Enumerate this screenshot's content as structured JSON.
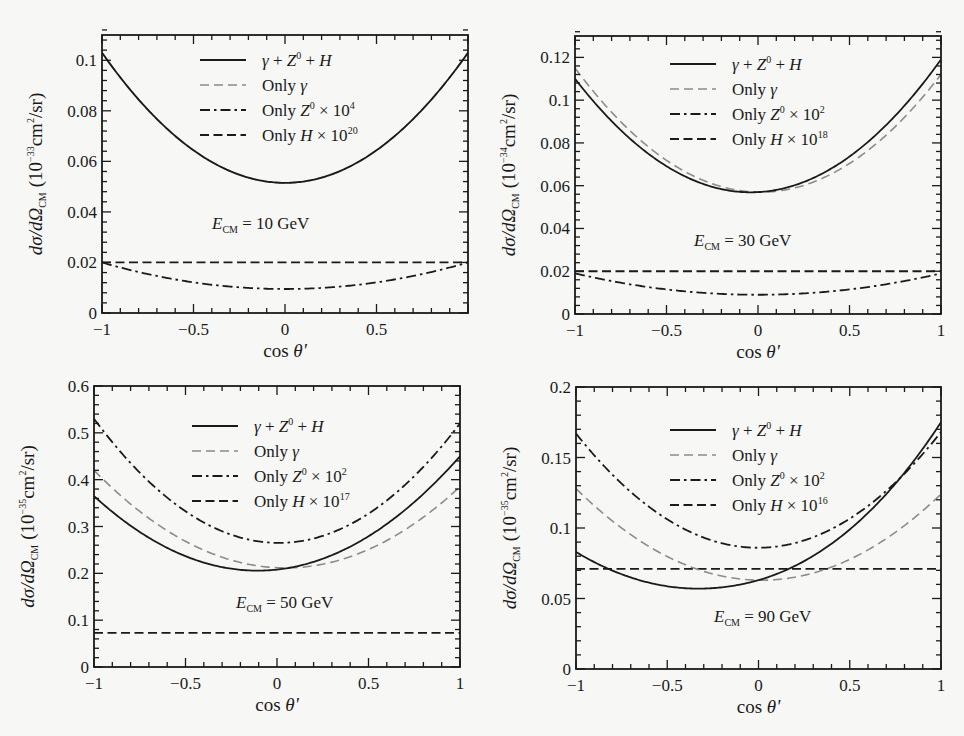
{
  "figure": {
    "x_axis_label": "cos θ'",
    "y_axis_label_prefix": "dσ/dΩ",
    "y_axis_label_sub": "CM",
    "colors": {
      "total": "#1a1a1a",
      "only_gamma": "#8c8c8c",
      "only_z": "#1a1a1a",
      "only_h": "#1a1a1a",
      "background": "#f7f7f5"
    }
  },
  "chart_data": [
    {
      "type": "line",
      "id": "panel-10gev",
      "annotation": "E_CM = 10 GeV",
      "annotation_energy": "= 10 GeV",
      "xlabel": "cos θ'",
      "ylabel": "dσ/dΩ_CM (10^-33 cm^2/sr)",
      "ylabel_exp": "−33",
      "xlim": [
        -1,
        1
      ],
      "ylim": [
        0,
        0.11
      ],
      "xticks": [
        -1,
        -0.5,
        0,
        0.5
      ],
      "xtick_labels": [
        "−1",
        "−0.5",
        "0",
        "0.5"
      ],
      "yticks": [
        0,
        0.02,
        0.04,
        0.06,
        0.08,
        0.1
      ],
      "ytick_labels": [
        "0",
        "0.02",
        "0.04",
        "0.06",
        "0.08",
        "0.1"
      ],
      "grid": false,
      "legend_position": "upper center",
      "frame": {
        "left": 102,
        "top": 35,
        "right": 468,
        "bottom": 313
      },
      "legend": {
        "x": 200,
        "y": 60,
        "dy": 25
      },
      "annot_pos": {
        "x": 212,
        "y": 229
      },
      "series": [
        {
          "name": "γ + Z⁰ + H",
          "legend_main": "γ + Z",
          "legend_sup": "0",
          "legend_tail": " + H",
          "style": "solid",
          "at_minus1": 0.103,
          "at_0": 0.0515,
          "at_plus1": 0.103,
          "min_x": 0.0
        },
        {
          "name": "Only γ",
          "legend_main": "Only γ",
          "legend_sup": "",
          "legend_tail": "",
          "style": "gray-dashed",
          "at_minus1": 0.103,
          "at_0": 0.0515,
          "at_plus1": 0.103,
          "min_x": 0.0
        },
        {
          "name": "Only Z⁰ × 10⁴",
          "legend_main": "Only Z",
          "legend_sup": "0",
          "legend_tail": " × 10",
          "legend_exp": "4",
          "style": "dash-dot",
          "at_minus1": 0.02,
          "at_0": 0.0095,
          "at_plus1": 0.02,
          "min_x": 0.0
        },
        {
          "name": "Only H × 10²⁰",
          "legend_main": "Only H",
          "legend_sup": "",
          "legend_tail": " × 10",
          "legend_exp": "20",
          "style": "dashed",
          "at_minus1": 0.02,
          "at_0": 0.02,
          "at_plus1": 0.02,
          "min_x": 0.0
        }
      ]
    },
    {
      "type": "line",
      "id": "panel-30gev",
      "annotation": "E_CM = 30 GeV",
      "annotation_energy": "= 30 GeV",
      "xlabel": "cos θ'",
      "ylabel": "dσ/dΩ_CM (10^-34 cm^2/sr)",
      "ylabel_exp": "−34",
      "xlim": [
        -1,
        1
      ],
      "ylim": [
        0,
        0.13
      ],
      "xticks": [
        -1,
        -0.5,
        0,
        0.5,
        1
      ],
      "xtick_labels": [
        "−1",
        "−0.5",
        "0",
        "0.5",
        "1"
      ],
      "yticks": [
        0,
        0.02,
        0.04,
        0.06,
        0.08,
        0.1,
        0.12
      ],
      "ytick_labels": [
        "0",
        "0.02",
        "0.04",
        "0.06",
        "0.08",
        "0.1",
        "0.12"
      ],
      "grid": false,
      "legend_position": "upper center",
      "frame": {
        "left": 575,
        "top": 36,
        "right": 941,
        "bottom": 314
      },
      "legend": {
        "x": 670,
        "y": 64,
        "dy": 25
      },
      "annot_pos": {
        "x": 694,
        "y": 246
      },
      "series": [
        {
          "name": "γ + Z⁰ + H",
          "legend_main": "γ + Z",
          "legend_sup": "0",
          "legend_tail": " + H",
          "style": "solid",
          "at_minus1": 0.11,
          "at_0": 0.057,
          "at_plus1": 0.119,
          "min_x": -0.02
        },
        {
          "name": "Only γ",
          "legend_main": "Only γ",
          "legend_sup": "",
          "legend_tail": "",
          "style": "gray-dashed",
          "at_minus1": 0.115,
          "at_0": 0.057,
          "at_plus1": 0.112,
          "min_x": 0.05
        },
        {
          "name": "Only Z⁰ × 10²",
          "legend_main": "Only Z",
          "legend_sup": "0",
          "legend_tail": " × 10",
          "legend_exp": "2",
          "style": "dash-dot",
          "at_minus1": 0.019,
          "at_0": 0.009,
          "at_plus1": 0.019,
          "min_x": 0.0
        },
        {
          "name": "Only H × 10¹⁸",
          "legend_main": "Only H",
          "legend_sup": "",
          "legend_tail": " × 10",
          "legend_exp": "18",
          "style": "dashed",
          "at_minus1": 0.02,
          "at_0": 0.02,
          "at_plus1": 0.02,
          "min_x": 0.0
        }
      ]
    },
    {
      "type": "line",
      "id": "panel-50gev",
      "annotation": "E_CM = 50 GeV",
      "annotation_energy": "= 50 GeV",
      "xlabel": "cos θ'",
      "ylabel": "dσ/dΩ_CM (10^-35 cm^2/sr)",
      "ylabel_exp": "−35",
      "xlim": [
        -1,
        1
      ],
      "ylim": [
        0,
        0.6
      ],
      "xticks": [
        -1,
        -0.5,
        0,
        0.5,
        1
      ],
      "xtick_labels": [
        "−1",
        "−0.5",
        "0",
        "0.5",
        "1"
      ],
      "yticks": [
        0,
        0.1,
        0.2,
        0.3,
        0.4,
        0.5,
        0.6
      ],
      "ytick_labels": [
        "0",
        "0.1",
        "0.2",
        "0.3",
        "0.4",
        "0.5",
        "0.6"
      ],
      "grid": false,
      "legend_position": "upper center",
      "frame": {
        "left": 94,
        "top": 386,
        "right": 460,
        "bottom": 667
      },
      "legend": {
        "x": 192,
        "y": 426,
        "dy": 25
      },
      "annot_pos": {
        "x": 236,
        "y": 608
      },
      "series": [
        {
          "name": "γ + Z⁰ + H",
          "legend_main": "γ + Z",
          "legend_sup": "0",
          "legend_tail": " + H",
          "style": "solid",
          "at_minus1": 0.365,
          "at_0": 0.208,
          "at_plus1": 0.45,
          "min_x": -0.08
        },
        {
          "name": "Only γ",
          "legend_main": "Only γ",
          "legend_sup": "",
          "legend_tail": "",
          "style": "gray-dashed",
          "at_minus1": 0.42,
          "at_0": 0.212,
          "at_plus1": 0.385,
          "min_x": -0.02
        },
        {
          "name": "Only Z⁰ × 10²",
          "legend_main": "Only Z",
          "legend_sup": "0",
          "legend_tail": " × 10",
          "legend_exp": "2",
          "style": "dash-dot",
          "at_minus1": 0.53,
          "at_0": 0.265,
          "at_plus1": 0.52,
          "min_x": 0.0
        },
        {
          "name": "Only H × 10¹⁷",
          "legend_main": "Only H",
          "legend_sup": "",
          "legend_tail": " × 10",
          "legend_exp": "17",
          "style": "dashed",
          "at_minus1": 0.073,
          "at_0": 0.073,
          "at_plus1": 0.073,
          "min_x": 0.0
        }
      ]
    },
    {
      "type": "line",
      "id": "panel-90gev",
      "annotation": "E_CM = 90 GeV",
      "annotation_energy": "= 90 GeV",
      "xlabel": "cos θ'",
      "ylabel": "dσ/dΩ_CM (10^-35 cm^2/sr)",
      "ylabel_exp": "−35",
      "xlim": [
        -1,
        1
      ],
      "ylim": [
        0,
        0.2
      ],
      "xticks": [
        -1,
        -0.5,
        0,
        0.5,
        1
      ],
      "xtick_labels": [
        "−1",
        "−0.5",
        "0",
        "0.5",
        "1"
      ],
      "yticks": [
        0,
        0.05,
        0.1,
        0.15,
        0.2
      ],
      "ytick_labels": [
        "0",
        "0.05",
        "0.1",
        "0.15",
        "0.2"
      ],
      "grid": false,
      "legend_position": "upper center",
      "frame": {
        "left": 576,
        "top": 387,
        "right": 941,
        "bottom": 669
      },
      "legend": {
        "x": 670,
        "y": 430,
        "dy": 25
      },
      "annot_pos": {
        "x": 714,
        "y": 622
      },
      "series": [
        {
          "name": "γ + Z⁰ + H",
          "legend_main": "γ + Z",
          "legend_sup": "0",
          "legend_tail": " + H",
          "style": "solid",
          "at_minus1": 0.083,
          "at_0": 0.063,
          "at_plus1": 0.175,
          "min_x": -0.33,
          "min_y": 0.057
        },
        {
          "name": "Only γ",
          "legend_main": "Only γ",
          "legend_sup": "",
          "legend_tail": "",
          "style": "gray-dashed",
          "at_minus1": 0.128,
          "at_0": 0.063,
          "at_plus1": 0.124,
          "min_x": 0.0
        },
        {
          "name": "Only Z⁰ × 10²",
          "legend_main": "Only Z",
          "legend_sup": "0",
          "legend_tail": " × 10",
          "legend_exp": "2",
          "style": "dash-dot",
          "at_minus1": 0.167,
          "at_0": 0.086,
          "at_plus1": 0.168,
          "min_x": 0.0
        },
        {
          "name": "Only H × 10¹⁶",
          "legend_main": "Only H",
          "legend_sup": "",
          "legend_tail": " × 10",
          "legend_exp": "16",
          "style": "dashed",
          "at_minus1": 0.071,
          "at_0": 0.071,
          "at_plus1": 0.071,
          "min_x": 0.0
        }
      ]
    }
  ]
}
